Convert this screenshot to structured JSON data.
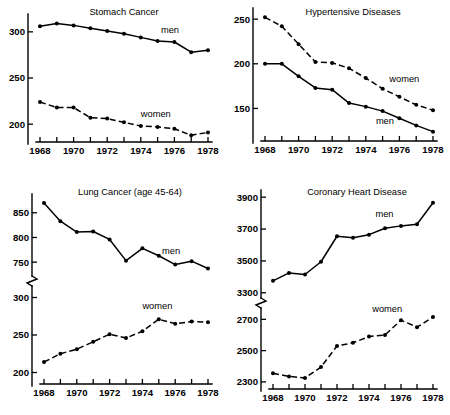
{
  "figure": {
    "name": "mortality-small-multiples",
    "panel_count": 4
  },
  "chart_data": [
    {
      "type": "line",
      "panel_id": "stomach-cancer",
      "title": "Stomach Cancer",
      "xlabel": "",
      "ylabel": "",
      "x": [
        1968,
        1969,
        1970,
        1971,
        1972,
        1973,
        1974,
        1975,
        1976,
        1977,
        1978
      ],
      "xlim": [
        1968,
        1978
      ],
      "ylim": [
        185,
        315
      ],
      "xticks": [
        1968,
        1969,
        1970,
        1971,
        1972,
        1973,
        1974,
        1975,
        1976,
        1977,
        1978
      ],
      "xticklabels": [
        "1968",
        "",
        "1970",
        "",
        "1972",
        "",
        "1974",
        "",
        "1976",
        "",
        "1978"
      ],
      "yticks": [
        200,
        250,
        300
      ],
      "yticklabels": [
        "200",
        "250",
        "300"
      ],
      "grid": false,
      "legend": "inline-annotation",
      "series": [
        {
          "name": "men",
          "style": "solid",
          "label_year": 1975.2,
          "label_value": 299,
          "values": [
            306,
            309,
            307,
            304,
            301,
            298,
            294,
            290,
            289,
            278,
            280
          ]
        },
        {
          "name": "women",
          "style": "dashed",
          "label_year": 1974.0,
          "label_value": 208,
          "values": [
            224,
            218,
            218,
            207,
            206,
            202,
            198,
            197,
            195,
            188,
            191
          ]
        }
      ]
    },
    {
      "type": "line",
      "panel_id": "hypertensive-diseases",
      "title": "Hypertensive Diseases",
      "xlabel": "",
      "ylabel": "",
      "x": [
        1968,
        1969,
        1970,
        1971,
        1972,
        1973,
        1974,
        1975,
        1976,
        1977,
        1978
      ],
      "xlim": [
        1968,
        1978
      ],
      "ylim": [
        118,
        258
      ],
      "xticks": [
        1968,
        1969,
        1970,
        1971,
        1972,
        1973,
        1974,
        1975,
        1976,
        1977,
        1978
      ],
      "xticklabels": [
        "1968",
        "",
        "1970",
        "",
        "1972",
        "",
        "1974",
        "",
        "1976",
        "",
        "1978"
      ],
      "yticks": [
        150,
        200,
        250
      ],
      "yticklabels": [
        "150",
        "200",
        "250"
      ],
      "grid": false,
      "legend": "inline-annotation",
      "series": [
        {
          "name": "women",
          "style": "dashed",
          "label_year": 1975.4,
          "label_value": 180,
          "values": [
            252,
            242,
            222,
            202,
            201,
            195,
            184,
            172,
            163,
            154,
            148
          ]
        },
        {
          "name": "men",
          "style": "solid",
          "label_year": 1974.6,
          "label_value": 133,
          "values": [
            200,
            200,
            186,
            173,
            171,
            156,
            152,
            147,
            139,
            131,
            124
          ]
        }
      ]
    },
    {
      "type": "line",
      "panel_id": "lung-cancer",
      "title": "Lung Cancer (age 45-64)",
      "xlabel": "",
      "ylabel": "",
      "x": [
        1968,
        1969,
        1970,
        1971,
        1972,
        1973,
        1974,
        1975,
        1976,
        1977,
        1978
      ],
      "xlim": [
        1968,
        1978
      ],
      "broken_axis": true,
      "axis_break_between": [
        310,
        730
      ],
      "yticks": [
        200,
        250,
        300,
        750,
        800,
        850
      ],
      "yticklabels": [
        "200",
        "250",
        "300",
        "750",
        "800",
        "850"
      ],
      "xticks": [
        1968,
        1969,
        1970,
        1971,
        1972,
        1973,
        1974,
        1975,
        1976,
        1977,
        1978
      ],
      "xticklabels": [
        "1968",
        "",
        "1970",
        "",
        "1972",
        "",
        "1974",
        "",
        "1976",
        "",
        "1978"
      ],
      "grid": false,
      "legend": "inline-annotation",
      "series": [
        {
          "name": "men",
          "style": "solid",
          "label_year": 1975.2,
          "label_value": 766,
          "values": [
            870,
            833,
            811,
            812,
            796,
            753,
            778,
            763,
            745,
            752,
            737
          ]
        },
        {
          "name": "women",
          "style": "dashed",
          "label_year": 1974.0,
          "label_value": 285,
          "values": [
            214,
            225,
            231,
            241,
            251,
            246,
            255,
            271,
            265,
            268,
            267
          ]
        }
      ]
    },
    {
      "type": "line",
      "panel_id": "coronary-heart-disease",
      "title": "Coronary Heart Disease",
      "xlabel": "",
      "ylabel": "",
      "x": [
        1968,
        1969,
        1970,
        1971,
        1972,
        1973,
        1974,
        1975,
        1976,
        1977,
        1978
      ],
      "xlim": [
        1968,
        1978
      ],
      "broken_axis": true,
      "axis_break_between": [
        2760,
        3280
      ],
      "yticks": [
        2300,
        2500,
        2700,
        3300,
        3500,
        3700,
        3900
      ],
      "yticklabels": [
        "2300",
        "2500",
        "2700",
        "3300",
        "3500",
        "3700",
        "3900"
      ],
      "xticks": [
        1968,
        1969,
        1970,
        1971,
        1972,
        1973,
        1974,
        1975,
        1976,
        1977,
        1978
      ],
      "xticklabels": [
        "1968",
        "",
        "1970",
        "",
        "1972",
        "",
        "1974",
        "",
        "1976",
        "",
        "1978"
      ],
      "grid": false,
      "legend": "inline-annotation",
      "series": [
        {
          "name": "men",
          "style": "solid",
          "label_year": 1974.4,
          "label_value": 3775,
          "values": [
            3375,
            3425,
            3415,
            3495,
            3655,
            3645,
            3665,
            3705,
            3720,
            3730,
            3865
          ]
        },
        {
          "name": "women",
          "style": "dashed",
          "label_year": 1974.2,
          "label_value": 2745,
          "values": [
            2355,
            2335,
            2325,
            2395,
            2530,
            2550,
            2590,
            2600,
            2695,
            2650,
            2715
          ]
        }
      ]
    }
  ]
}
